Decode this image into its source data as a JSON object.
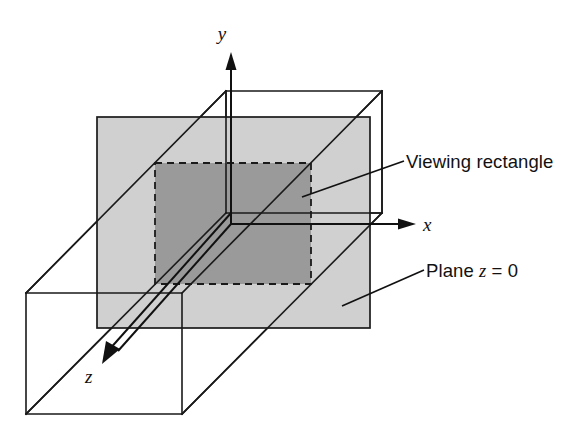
{
  "figure": {
    "background_color": "#ffffff",
    "line_color": "#1a1a1a",
    "plane_color": "#d0d0d0",
    "viewing_rect_color": "#9a9a9a"
  },
  "axes": [
    {
      "id": "y",
      "label": "y",
      "direction": "up",
      "label_x": 222,
      "label_y": 40
    },
    {
      "id": "x",
      "label": "x",
      "direction": "right",
      "label_x": 423,
      "label_y": 229
    },
    {
      "id": "z",
      "label": "z",
      "direction": "down-left",
      "label_x": 85,
      "label_y": 383
    }
  ],
  "callouts": [
    {
      "id": "viewing-rectangle",
      "text": "Viewing rectangle",
      "text_x": 406,
      "text_y": 168,
      "leader_from_x": 302,
      "leader_from_y": 197,
      "leader_to_x": 404,
      "leader_to_y": 161
    },
    {
      "id": "plane-z-0",
      "text_prefix": "Plane ",
      "text_var": "z",
      "text_suffix": " = 0",
      "text_full": "Plane z = 0",
      "text_x": 426,
      "text_y": 277,
      "leader_from_x": 342,
      "leader_from_y": 306,
      "leader_to_x": 424,
      "leader_to_y": 270
    }
  ],
  "shapes": {
    "plane_z0": {
      "name": "Plane z = 0",
      "x": 97,
      "y": 117,
      "width": 273,
      "height": 211
    },
    "viewing_rectangle": {
      "name": "Viewing rectangle",
      "x": 155,
      "y": 163,
      "width": 156,
      "height": 121,
      "border_style": "dashed"
    },
    "view_volume_box": {
      "name": "View volume box",
      "back_face": {
        "x": 226,
        "y": 91,
        "width": 156,
        "height": 122
      },
      "front_face": {
        "x": 26,
        "y": 293,
        "width": 156,
        "height": 121
      },
      "projection_offset_x": -200,
      "projection_offset_y": 202
    }
  }
}
